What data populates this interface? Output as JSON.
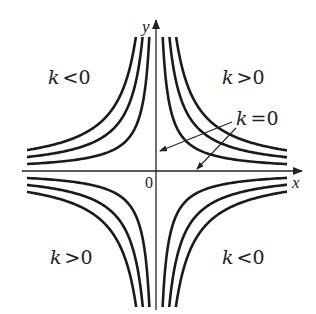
{
  "diagram": {
    "type": "level-curves",
    "axes": {
      "x_label": "x",
      "y_label": "y",
      "origin_label": "0"
    },
    "level_values": [
      1,
      2,
      3
    ],
    "regions": [
      {
        "id": "top-left",
        "sign": "k<0",
        "k": "k",
        "op": "<",
        "val": "0"
      },
      {
        "id": "top-right",
        "sign": "k>0",
        "k": "k",
        "op": ">",
        "val": "0"
      },
      {
        "id": "bottom-left",
        "sign": "k>0",
        "k": "k",
        "op": ">",
        "val": "0"
      },
      {
        "id": "bottom-right",
        "sign": "k<0",
        "k": "k",
        "op": "<",
        "val": "0"
      }
    ],
    "annotation": {
      "k": "k",
      "op": "=",
      "val": "0",
      "points_to": [
        "y-axis",
        "x-axis"
      ]
    },
    "colors": {
      "curve": "#1a1a1a",
      "axis": "#222222",
      "background": "#ffffff"
    }
  }
}
